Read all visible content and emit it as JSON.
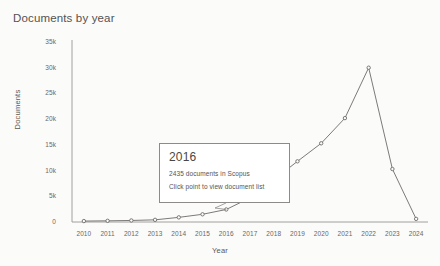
{
  "chart_data": {
    "type": "line",
    "title": "Documents by year",
    "xlabel": "Year",
    "ylabel": "Documents",
    "categories": [
      "2010",
      "2011",
      "2012",
      "2013",
      "2014",
      "2015",
      "2016",
      "2017",
      "2018",
      "2019",
      "2020",
      "2021",
      "2022",
      "2023",
      "2024"
    ],
    "values": [
      180,
      230,
      300,
      420,
      900,
      1500,
      2435,
      4700,
      8200,
      11800,
      15300,
      20200,
      30000,
      10300,
      600
    ],
    "series": [
      {
        "name": "Documents",
        "values": [
          180,
          230,
          300,
          420,
          900,
          1500,
          2435,
          4700,
          8200,
          11800,
          15300,
          20200,
          30000,
          10300,
          600
        ]
      }
    ],
    "ylim": [
      0,
      35000
    ],
    "yticks": [
      0,
      5000,
      10000,
      15000,
      20000,
      25000,
      30000,
      35000
    ],
    "ytick_labels": [
      "0",
      "5k",
      "10k",
      "15k",
      "20k",
      "25k",
      "30k",
      "35k"
    ],
    "grid": false,
    "legend": "none",
    "line_color": "#6e6b68",
    "marker_color": "#6e6b68",
    "background_color": "#fbfbfa"
  },
  "tooltip": {
    "year": "2016",
    "count_text": "2435 documents in Scopus",
    "hint_text": "Click point to view document list",
    "anchor_year": "2016",
    "anchor_value": 2435
  }
}
